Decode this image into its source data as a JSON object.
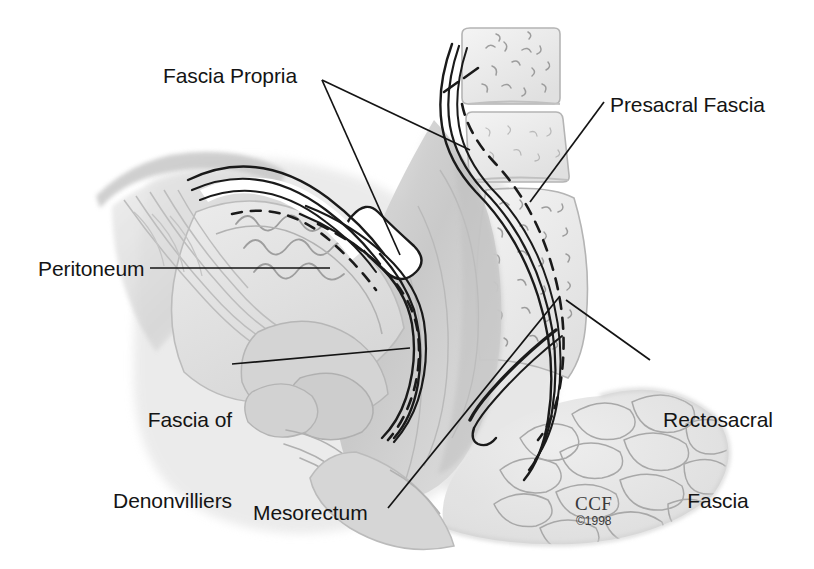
{
  "figure": {
    "style": "grayscale medical pen-and-ink with wash",
    "background_color": "#ffffff",
    "ink_color": "#141414",
    "wash_color": "#c9c9c9"
  },
  "labels": [
    {
      "id": "fascia-propria",
      "text": "Fascia Propria",
      "lines": [
        "Fascia Propria"
      ],
      "x": 163,
      "y": 63,
      "align": "left",
      "leaders": 2
    },
    {
      "id": "presacral-fascia",
      "text": "Presacral Fascia",
      "lines": [
        "Presacral Fascia"
      ],
      "x": 610,
      "y": 92,
      "align": "left",
      "leaders": 1
    },
    {
      "id": "peritoneum",
      "text": "Peritoneum",
      "lines": [
        "Peritoneum"
      ],
      "x": 38,
      "y": 256,
      "align": "left",
      "leaders": 1
    },
    {
      "id": "fascia-of-denonvilliers",
      "text": "Fascia of Denonvilliers",
      "lines": [
        "Fascia of",
        "Denonvilliers"
      ],
      "x": 108,
      "y": 352,
      "align": "left",
      "leaders": 1
    },
    {
      "id": "rectosacral-fascia",
      "text": "Rectosacral Fascia",
      "lines": [
        "Rectosacral",
        "Fascia"
      ],
      "x": 655,
      "y": 352,
      "align": "left",
      "leaders": 1
    },
    {
      "id": "mesorectum",
      "text": "Mesorectum",
      "lines": [
        "Mesorectum"
      ],
      "x": 253,
      "y": 500,
      "align": "left",
      "leaders": 1
    }
  ],
  "signature": {
    "mark": "CCF",
    "copyright": "©1998"
  },
  "structures": [
    "sacral vertebral bodies",
    "presacral fascia",
    "rectosacral fascia",
    "rectum",
    "mesorectum",
    "fascia propria of rectum",
    "peritoneal reflection",
    "fascia of Denonvilliers",
    "urinary bladder",
    "prostate",
    "seminal vesicle",
    "levator ani",
    "anal canal",
    "ischiorectal fat"
  ]
}
